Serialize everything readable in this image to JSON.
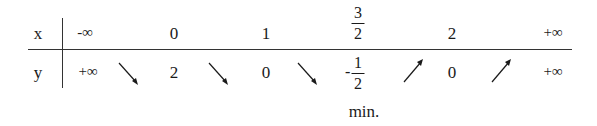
{
  "table": {
    "row_labels": {
      "x": "x",
      "y": "y"
    },
    "x_values": [
      {
        "label": "-∞"
      },
      {
        "label": "0"
      },
      {
        "label": "1"
      },
      {
        "numerator": "3",
        "denominator": "2"
      },
      {
        "label": "2"
      },
      {
        "label": "+∞"
      }
    ],
    "y_values": [
      {
        "label": "+∞"
      },
      {
        "label": "2"
      },
      {
        "label": "0"
      },
      {
        "sign": "-",
        "numerator": "1",
        "denominator": "2"
      },
      {
        "label": "0"
      },
      {
        "label": "+∞"
      }
    ],
    "arrows": [
      "decreasing",
      "decreasing",
      "decreasing",
      "increasing",
      "increasing"
    ],
    "annotation": "min."
  }
}
